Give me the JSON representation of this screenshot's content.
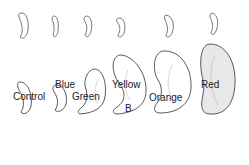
{
  "figure": {
    "panel_label": "B",
    "labels": [
      {
        "name": "Control"
      },
      {
        "name": "Blue"
      },
      {
        "name": "Green"
      },
      {
        "name": "Yellow"
      },
      {
        "name": "Orange"
      },
      {
        "name": "Red"
      }
    ]
  }
}
